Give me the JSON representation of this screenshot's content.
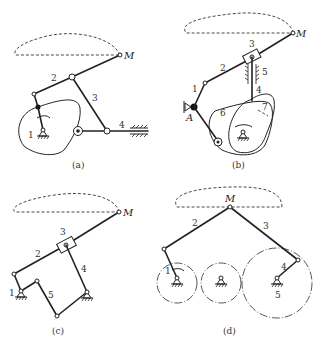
{
  "figure": {
    "panels": [
      {
        "id": "a",
        "caption": "(a)",
        "point_label": "M",
        "link_labels": [
          "1",
          "2",
          "3",
          "4"
        ]
      },
      {
        "id": "b",
        "caption": "(b)",
        "point_label": "M",
        "pivot_label": "A",
        "link_labels": [
          "1",
          "2",
          "3",
          "4",
          "5",
          "6",
          "7"
        ]
      },
      {
        "id": "c",
        "caption": "(c)",
        "point_label": "M",
        "link_labels": [
          "1",
          "2",
          "3",
          "4",
          "5"
        ]
      },
      {
        "id": "d",
        "caption": "(d)",
        "point_label": "M",
        "link_labels": [
          "1",
          "2",
          "3",
          "4",
          "5"
        ]
      }
    ]
  }
}
